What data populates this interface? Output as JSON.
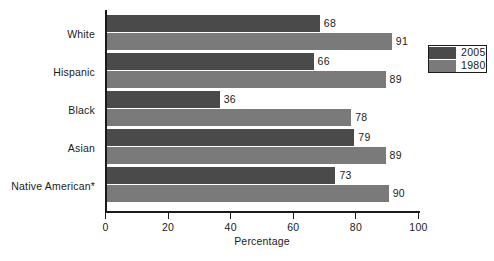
{
  "chart_data": {
    "type": "bar",
    "orientation": "horizontal",
    "title": "",
    "xlabel": "Percentage",
    "ylabel": "",
    "xlim": [
      0,
      100
    ],
    "xticks": [
      0,
      20,
      40,
      60,
      80,
      100
    ],
    "grid": false,
    "legend_position": "right",
    "categories": [
      "White",
      "Hispanic",
      "Black",
      "Asian",
      "Native American*"
    ],
    "series": [
      {
        "name": "2005",
        "color": "#4a4a4a",
        "values": [
          68,
          66,
          36,
          79,
          73
        ]
      },
      {
        "name": "1980",
        "color": "#7a7a7a",
        "values": [
          91,
          89,
          78,
          89,
          90
        ]
      }
    ],
    "data_labels": {
      "2005": [
        "68",
        "66",
        "36",
        "79",
        "73"
      ],
      "1980": [
        "91",
        "89",
        "78",
        "89",
        "90"
      ]
    }
  },
  "legend": {
    "items": [
      {
        "label": "2005",
        "color": "#4a4a4a"
      },
      {
        "label": "1980",
        "color": "#7a7a7a"
      }
    ]
  },
  "axis": {
    "x_title": "Percentage",
    "tick_labels": [
      "0",
      "20",
      "40",
      "60",
      "80",
      "100"
    ]
  }
}
